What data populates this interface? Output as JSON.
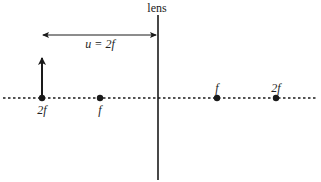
{
  "diagram": {
    "type": "optics-thin-lens",
    "lens": {
      "label": "lens",
      "x": 158,
      "y_top": 15,
      "y_bottom": 180
    },
    "principal_axis": {
      "style": "dotted",
      "y": 98,
      "x_start": 3,
      "x_end": 316
    },
    "object_arrow": {
      "x": 42,
      "base_y": 98,
      "tip_y": 57,
      "direction": "up"
    },
    "distance_marker": {
      "label": "u = 2f",
      "x_start": 42,
      "x_end": 157,
      "y": 35,
      "label_x": 100,
      "label_y": 47
    },
    "points": [
      {
        "label": "2f",
        "x": 42,
        "side": "left",
        "label_position": "below"
      },
      {
        "label": "f",
        "x": 100,
        "side": "left",
        "label_position": "below"
      },
      {
        "label": "f",
        "x": 217,
        "side": "right",
        "label_position": "above"
      },
      {
        "label": "2f",
        "x": 276,
        "side": "right",
        "label_position": "above"
      }
    ],
    "colors": {
      "line": "#1a1a1a",
      "text": "#222222",
      "background": "#ffffff"
    }
  }
}
